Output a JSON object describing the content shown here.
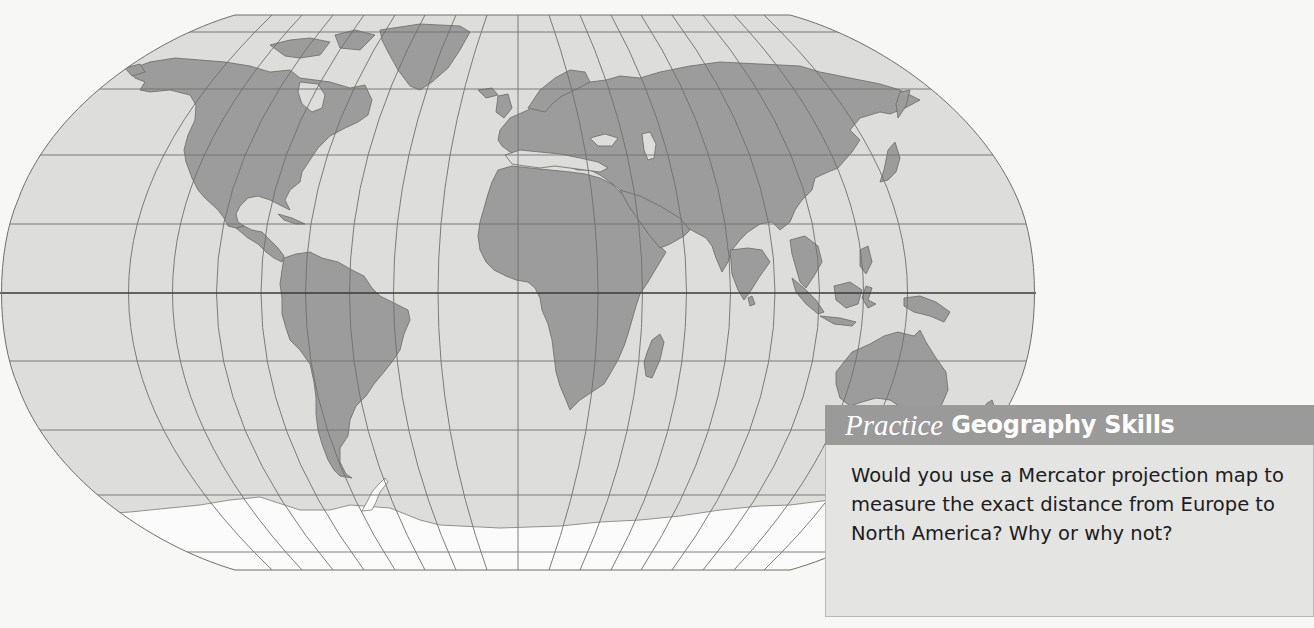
{
  "map": {
    "title": "World map (Robinson-style projection)",
    "colors": {
      "ocean": "#dddddc",
      "land": "#9c9c9c",
      "ice": "#fbfbfb",
      "grid": "#6f6f6f",
      "equator": "#3a3a3a",
      "page": "#f7f7f6"
    },
    "continents": [
      "North America",
      "South America",
      "Europe",
      "Africa",
      "Asia",
      "Australia",
      "Antarctica",
      "Greenland"
    ]
  },
  "practice": {
    "label_italic": "Practice",
    "label_bold": "Geography Skills",
    "question": "Would you use a Mercator projection map to measure the exact distance from Europe to North America? Why or why not?",
    "colors": {
      "header_bg": "#9a9a9a",
      "body_bg": "#e4e4e3",
      "header_text": "#ffffff",
      "body_text": "#1c1c1c"
    }
  }
}
